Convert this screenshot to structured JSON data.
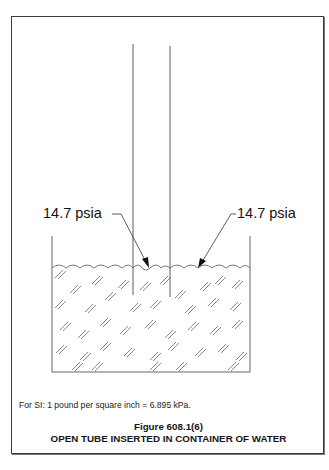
{
  "figure": {
    "number": "Figure 608.1(6)",
    "title": "OPEN TUBE INSERTED IN CONTAINER OF WATER"
  },
  "labels": {
    "left_pressure": "14.7 psia",
    "right_pressure": "14.7 psia"
  },
  "note": {
    "si_conversion": "For SI:  1 pound per square inch = 6.895 kPa."
  },
  "diagram": {
    "elements": [
      "open-tube",
      "container",
      "water",
      "pressure-leader-arrows"
    ],
    "line_color": "#3a3a3a",
    "hatch_color": "#555555",
    "background": "#ffffff"
  }
}
